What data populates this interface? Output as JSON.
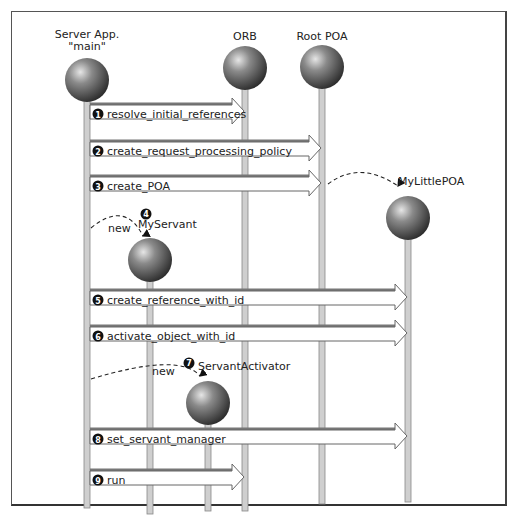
{
  "diagram": {
    "type": "sequence",
    "objects": [
      {
        "id": "server",
        "label_lines": [
          "Server App.",
          "\"main\""
        ]
      },
      {
        "id": "orb",
        "label_lines": [
          "ORB"
        ]
      },
      {
        "id": "rootpoa",
        "label_lines": [
          "Root POA"
        ]
      },
      {
        "id": "mylittlepoa",
        "label_lines": [
          "MyLittlePOA"
        ]
      },
      {
        "id": "myservant",
        "label_lines": [
          "MyServant"
        ]
      },
      {
        "id": "activator",
        "label_lines": [
          "ServantActivator"
        ]
      }
    ],
    "messages": [
      {
        "num": "1",
        "label": "resolve_initial_references",
        "from": "server",
        "to": "orb"
      },
      {
        "num": "2",
        "label": "create_request_processing_policy",
        "from": "server",
        "to": "rootpoa"
      },
      {
        "num": "3",
        "label": "create_POA",
        "from": "server",
        "to": "rootpoa"
      },
      {
        "num": "4",
        "label": "new",
        "from": "server",
        "to": "myservant",
        "style": "dashed-create"
      },
      {
        "num": "5",
        "label": "create_reference_with_id",
        "from": "server",
        "to": "mylittlepoa"
      },
      {
        "num": "6",
        "label": "activate_object_with_id",
        "from": "server",
        "to": "mylittlepoa"
      },
      {
        "num": "7",
        "label": "new",
        "from": "server",
        "to": "activator",
        "style": "dashed-create"
      },
      {
        "num": "8",
        "label": "set_servant_manager",
        "from": "server",
        "to": "mylittlepoa"
      },
      {
        "num": "9",
        "label": "run",
        "from": "server",
        "to": "orb"
      }
    ],
    "create_edge": {
      "from": "rootpoa",
      "to": "mylittlepoa",
      "style": "dashed"
    },
    "colors": {
      "sphere_light": "#d8d8d8",
      "sphere_dark": "#2e2e2e",
      "lifeline": "#cfcfcf",
      "lifeline_border": "#888888",
      "badge": "#111111",
      "arrow_fill": "#ffffff",
      "arrow_stroke": "#666666"
    }
  }
}
